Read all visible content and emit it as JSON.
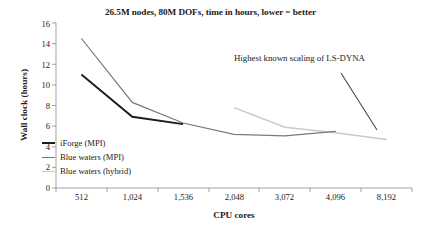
{
  "chart_data": {
    "type": "line",
    "title": "26.5M nodes, 80M DOFs, time in hours, lower = better",
    "xlabel": "CPU cores",
    "ylabel": "Wall clock (hours)",
    "categories": [
      "512",
      "1,024",
      "1,536",
      "2,048",
      "3,072",
      "4,096",
      "8,192"
    ],
    "ylim": [
      0,
      16
    ],
    "yticks": [
      "0",
      "2",
      "4",
      "6",
      "8",
      "10",
      "12",
      "14",
      "16"
    ],
    "grid": false,
    "legend_position": "inside-lower-left",
    "series": [
      {
        "name": "iForge (MPI)",
        "color": "#1c1c1c",
        "width": 1.9,
        "points": [
          {
            "x": "512",
            "y": 11.0
          },
          {
            "x": "1,024",
            "y": 6.9
          },
          {
            "x": "1,536",
            "y": 6.2
          }
        ]
      },
      {
        "name": "Blue waters (MPI)",
        "color": "#7a7a7a",
        "width": 1.2,
        "points": [
          {
            "x": "512",
            "y": 14.5
          },
          {
            "x": "1,024",
            "y": 8.3
          },
          {
            "x": "1,536",
            "y": 6.3
          },
          {
            "x": "2,048",
            "y": 5.2
          },
          {
            "x": "3,072",
            "y": 5.05
          },
          {
            "x": "4,096",
            "y": 5.5
          }
        ]
      },
      {
        "name": "Blue waters (hybrid)",
        "color": "#c9c9c9",
        "width": 1.4,
        "points": [
          {
            "x": "2,048",
            "y": 7.8
          },
          {
            "x": "3,072",
            "y": 5.9
          },
          {
            "x": "4,096",
            "y": 5.35
          },
          {
            "x": "8,192",
            "y": 4.7
          }
        ]
      }
    ],
    "annotations": [
      {
        "text": "Highest known scaling of LS-DYNA",
        "color": "#4a4a4a",
        "leader_line": {
          "from": {
            "x_px": 341,
            "y_px": 73
          },
          "to": {
            "x_px": 377,
            "y_px": 130
          }
        }
      }
    ]
  }
}
